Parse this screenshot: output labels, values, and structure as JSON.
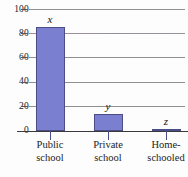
{
  "chart_data": {
    "type": "bar",
    "title": "",
    "subtitle": "",
    "xlabel": "",
    "ylabel": "",
    "categories": [
      "Public school",
      "Private school",
      "Home-schooled"
    ],
    "category_lines": [
      [
        "Public",
        "school"
      ],
      [
        "Private",
        "school"
      ],
      [
        "Home-",
        "schooled"
      ]
    ],
    "values": [
      85,
      14,
      2
    ],
    "point_labels": [
      "x",
      "y",
      "z"
    ],
    "ylim": [
      0,
      100
    ],
    "yticks": [
      0,
      20,
      40,
      60,
      80,
      100
    ],
    "ytick_labels": [
      "0",
      "20",
      "40",
      "60",
      "80",
      "100"
    ],
    "grid": true,
    "grid_axis": "y",
    "legend": false,
    "legend_position": "none",
    "colors": {
      "bar_fill": "#7b7fd0",
      "bar_edge": "#4a4d86",
      "gridline": "#8f8f94",
      "axis": "#3a3a3f",
      "text": "#1c1c1c",
      "background": "#fdfdfd"
    }
  }
}
